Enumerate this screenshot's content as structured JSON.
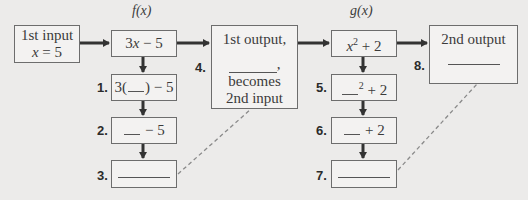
{
  "diagram": {
    "f_label": "f(x)",
    "g_label": "g(x)",
    "input_box": {
      "line1": "1st input",
      "line2_var": "x",
      "line2_rest": " = 5"
    },
    "f_box": {
      "coef": "3",
      "var": "x",
      "rest": " − 5"
    },
    "g_box": {
      "var": "x",
      "exp": "2",
      "rest": " + 2"
    },
    "steps": [
      {
        "number": "1.",
        "prefix": "3(",
        "suffix": ") − 5"
      },
      {
        "number": "2.",
        "suffix": " − 5"
      },
      {
        "number": "3."
      },
      {
        "number": "4.",
        "line1": "1st output,",
        "line3": "becomes",
        "line4": "2nd input",
        "comma": ","
      },
      {
        "number": "5.",
        "exp": "2",
        "suffix": " + 2"
      },
      {
        "number": "6.",
        "suffix": " + 2"
      },
      {
        "number": "7."
      },
      {
        "number": "8.",
        "line1": "2nd output"
      }
    ],
    "colors": {
      "background": "#ecebea",
      "box_fill": "#f3f2f1",
      "box_border": "#6d6d6d",
      "arrow": "#333333",
      "dashed": "#8a8a8a"
    }
  }
}
